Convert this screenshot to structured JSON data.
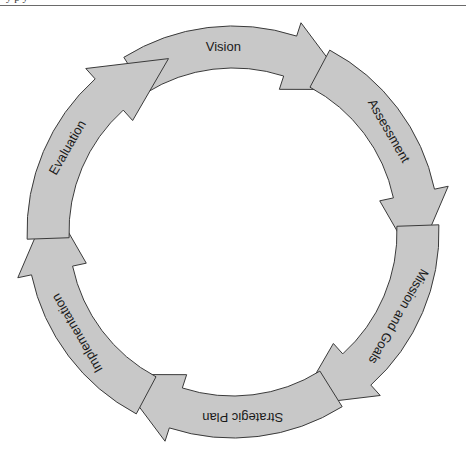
{
  "header": {
    "cut_off_text": "y        p        y"
  },
  "diagram": {
    "type": "cycle",
    "center": [
      233,
      232
    ],
    "outer_radius": 206,
    "inner_radius": 164,
    "fill_color": "#c8c8c8",
    "stroke_color": "#3a3a3a",
    "direction": "clockwise",
    "stages": [
      {
        "label": "Vision",
        "angle": 0
      },
      {
        "label": "Assessment",
        "angle": 60
      },
      {
        "label": "Mission and Goals",
        "angle": 120
      },
      {
        "label": "Strategic Plan",
        "angle": 180
      },
      {
        "label": "Implementation",
        "angle": 240
      },
      {
        "label": "Evaluation",
        "angle": 300
      }
    ]
  }
}
